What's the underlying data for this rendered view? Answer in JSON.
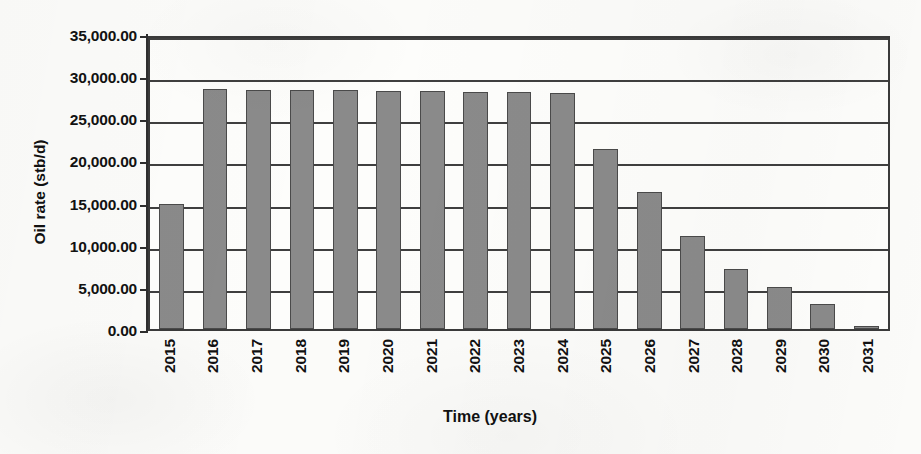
{
  "chart_data": {
    "type": "bar",
    "title": "",
    "xlabel": "Time (years)",
    "ylabel": "Oil rate (stb/d)",
    "categories": [
      "2015",
      "2016",
      "2017",
      "2018",
      "2019",
      "2020",
      "2021",
      "2022",
      "2023",
      "2024",
      "2025",
      "2026",
      "2027",
      "2028",
      "2029",
      "2030",
      "2031"
    ],
    "values": [
      14850,
      28450,
      28400,
      28350,
      28300,
      28250,
      28200,
      28150,
      28100,
      28000,
      21350,
      16250,
      11000,
      7100,
      4950,
      3000,
      400
    ],
    "series": [
      {
        "name": "Oil rate",
        "values": [
          14850,
          28450,
          28400,
          28350,
          28300,
          28250,
          28200,
          28150,
          28100,
          28000,
          21350,
          16250,
          11000,
          7100,
          4950,
          3000,
          400
        ]
      }
    ],
    "ylim": [
      0,
      35000
    ],
    "ytick_values": [
      0,
      5000,
      10000,
      15000,
      20000,
      25000,
      30000,
      35000
    ],
    "ytick_labels": [
      "0.00",
      "5,000.00",
      "10,000.00",
      "15,000.00",
      "20,000.00",
      "25,000.00",
      "30,000.00",
      "35,000.00"
    ],
    "grid": true,
    "grid_axis": "y",
    "legend": false,
    "legend_position": "none",
    "bar_color": "#8a8a8a",
    "bar_border_color": "#4a4a4a",
    "axis_color": "#2e2e2e",
    "plot_background": "#fdfdfb",
    "xtick_rotation": -90
  },
  "axes": {
    "y_title": "Oil rate (stb/d)",
    "x_title": "Time (years)"
  }
}
